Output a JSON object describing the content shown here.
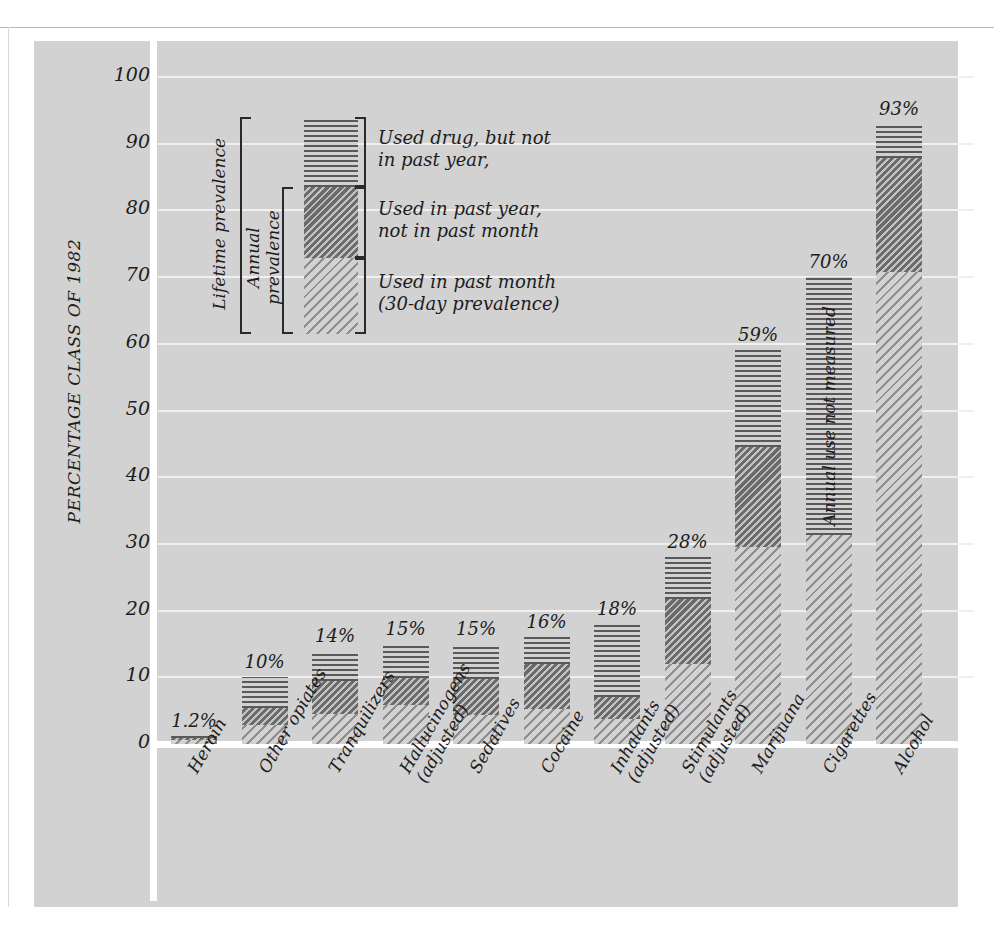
{
  "chart_data": {
    "type": "bar",
    "subtype": "stacked-bar",
    "title": "",
    "xlabel": "",
    "ylabel": "PERCENTAGE CLASS OF 1982",
    "ylim": [
      0,
      100
    ],
    "yticks": [
      0,
      10,
      20,
      30,
      40,
      50,
      60,
      70,
      80,
      90,
      100
    ],
    "ytick_labels": [
      "0",
      "10",
      "20",
      "30",
      "40",
      "50",
      "60",
      "70",
      "80",
      "90",
      "100"
    ],
    "grid": true,
    "legend_position": "inside-upper-left",
    "categories": [
      "Heroin",
      "Other opiates",
      "Tranquilizers",
      "Hallucinogens (adjusted)",
      "Sedatives",
      "Cocaine",
      "Inhalants (adjusted)",
      "Stimulants (adjusted)",
      "Marijuana",
      "Cigarettes",
      "Alcohol"
    ],
    "category_lines": [
      [
        "Heroin"
      ],
      [
        "Other opiates"
      ],
      [
        "Tranquilizers"
      ],
      [
        "Hallucinogens",
        "(adjusted)"
      ],
      [
        "Sedatives"
      ],
      [
        "Cocaine"
      ],
      [
        "Inhalants",
        "(adjusted)"
      ],
      [
        "Stimulants",
        "(adjusted)"
      ],
      [
        "Marijuana"
      ],
      [
        "Cigarettes"
      ],
      [
        "Alcohol"
      ]
    ],
    "series": [
      {
        "name": "Used in past month (30-day prevalence)",
        "key": "month",
        "values": [
          0.6,
          2.8,
          4.5,
          5.8,
          4.4,
          5.2,
          3.8,
          12.0,
          29.5,
          31.4,
          70.8
        ]
      },
      {
        "name": "Used in past year, not in past month",
        "key": "year",
        "values": [
          0.3,
          2.6,
          5.0,
          4.1,
          5.3,
          6.8,
          3.2,
          9.7,
          15.0,
          null,
          17.0
        ]
      },
      {
        "name": "Used drug, but not in past year",
        "key": "lifetime",
        "values": [
          0.3,
          4.6,
          4.5,
          5.1,
          5.3,
          4.0,
          11.0,
          6.3,
          14.5,
          38.6,
          5.2
        ]
      }
    ],
    "totals": [
      1.2,
      10,
      14,
      15,
      15,
      16,
      18,
      28,
      59,
      70,
      93
    ],
    "value_labels": [
      "1.2%",
      "10%",
      "14%",
      "15%",
      "15%",
      "16%",
      "18%",
      "28%",
      "59%",
      "70%",
      "93%"
    ],
    "annotations": [
      {
        "text": "Annual use not measured",
        "category": "Cigarettes",
        "orientation": "vertical"
      }
    ],
    "legend": {
      "bracket_labels": [
        "Lifetime prevalence",
        "Annual prevalence"
      ],
      "entries": [
        {
          "key": "lifetime",
          "lines": [
            "Used drug, but not",
            "in past year,"
          ]
        },
        {
          "key": "year",
          "lines": [
            "Used in past year,",
            "not in past month"
          ]
        },
        {
          "key": "month",
          "lines": [
            "Used in past month",
            "(30-day prevalence)"
          ]
        }
      ]
    },
    "colors": {
      "panel_background": "#d2d2d2",
      "page_background": "#ffffff",
      "gridline": "#f0f0f0",
      "axis": "#ffffff",
      "ink": "#1c1c1c",
      "hatch_lifetime": "#595959",
      "hatch_year": "#6b6b6b",
      "hatch_month": "#8e8e8e"
    }
  }
}
